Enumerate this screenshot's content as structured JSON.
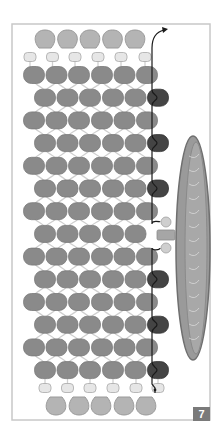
{
  "figure": {
    "step_number": "7",
    "frame": {
      "x": 12,
      "y": 24,
      "width": 198,
      "height": 396,
      "stroke": "#c8c8c8"
    },
    "colors": {
      "main_bead": "#8a8a8a",
      "main_bead_stroke": "#7a7a7a",
      "dark_bead": "#444444",
      "seed_bead": "#e6e6e6",
      "seed_bead_stroke": "#a8a8a8",
      "drop_bead": "#b4b4b4",
      "drop_bead_stroke": "#9a9a9a",
      "thread_light": "#cfcfcf",
      "thread_dark": "#1a1a1a",
      "coin": "#9a9a9a",
      "coin_rim": "#6f6f6f",
      "badge_bg": "#7a7a7a"
    },
    "top_fringe": {
      "drop_beads_x": [
        45,
        67.5,
        90,
        112.5,
        135
      ],
      "drop_y": 40,
      "seed_beads_x": [
        30,
        52.5,
        75,
        98,
        121,
        145
      ],
      "seed_y": 57
    },
    "bottom_fringe": {
      "drop_beads_x": [
        56,
        79,
        101,
        124,
        146
      ],
      "drop_y": 405,
      "seed_beads_x": [
        45,
        67.5,
        90,
        113,
        136,
        158
      ],
      "seed_y": 388
    },
    "rows": {
      "count": 14,
      "first_y": 75,
      "spacing": 22.7,
      "a_row_x": [
        34,
        56.5,
        79,
        102,
        124.5,
        147
      ],
      "b_row_x": [
        45,
        67.5,
        90,
        113,
        135.5
      ],
      "dark_bead_x": 158,
      "dark_on_b_rows": [
        1,
        2,
        3,
        5,
        6,
        7
      ],
      "coin_connect_b_row": 4
    },
    "coin": {
      "cx": 193,
      "cy": 248,
      "rx": 17,
      "ry": 112
    },
    "coin_loop": {
      "seed_top_y": 222,
      "tube_y": 235,
      "seed_bottom_y": 248,
      "x": 166
    }
  }
}
